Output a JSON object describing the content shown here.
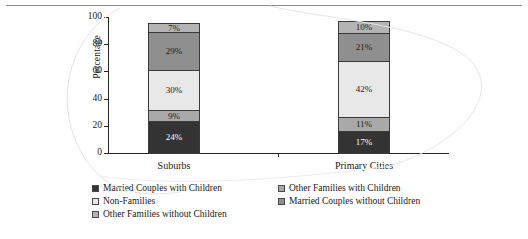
{
  "chart_data": {
    "type": "bar",
    "subtype": "stacked-100-percent",
    "title": "",
    "xlabel": "",
    "ylabel": "Percentage",
    "ylim": [
      0,
      100
    ],
    "yticks": [
      0,
      20,
      40,
      60,
      80,
      100
    ],
    "grid": false,
    "legend_position": "bottom",
    "categories": [
      "Suburbs",
      "Primary Cities"
    ],
    "series": [
      {
        "name": "Married Couples with Children",
        "color": "#333333",
        "label_color": "#ffffff",
        "values": [
          24,
          17
        ],
        "labels": [
          "24%",
          "17%"
        ]
      },
      {
        "name": "Other Families with Children",
        "color": "#a9a9a9",
        "label_color": "#1a1a1a",
        "values": [
          9,
          11
        ],
        "labels": [
          "9%",
          "11%"
        ]
      },
      {
        "name": "Non-Families",
        "color": "#e8e8e8",
        "label_color": "#1a1a1a",
        "values": [
          30,
          42
        ],
        "labels": [
          "30%",
          "42%"
        ]
      },
      {
        "name": "Married Couples without Children",
        "color": "#8f8f8f",
        "label_color": "#1a1a1a",
        "values": [
          29,
          21
        ],
        "labels": [
          "29%",
          "21%"
        ]
      },
      {
        "name": "Other Families without Children",
        "color": "#b4b4b4",
        "label_color": "#1a1a1a",
        "values": [
          7,
          10
        ],
        "labels": [
          "7%",
          "10%"
        ]
      }
    ]
  },
  "axis": {
    "y_title": "Percentage",
    "y_ticks": [
      "100",
      "80",
      "60",
      "40",
      "20",
      "0"
    ],
    "x_labels": [
      "Suburbs",
      "Primary Cities"
    ]
  },
  "legend": {
    "rows": [
      [
        {
          "label": "Married Couples with Children",
          "color": "#333333"
        },
        {
          "label": "Other Families with Children",
          "color": "#a9a9a9"
        }
      ],
      [
        {
          "label": "Non-Families",
          "color": "#e8e8e8"
        },
        {
          "label": "Married Couples without Children",
          "color": "#8f8f8f"
        }
      ],
      [
        {
          "label": "Other Families without Children",
          "color": "#b4b4b4"
        }
      ]
    ]
  }
}
